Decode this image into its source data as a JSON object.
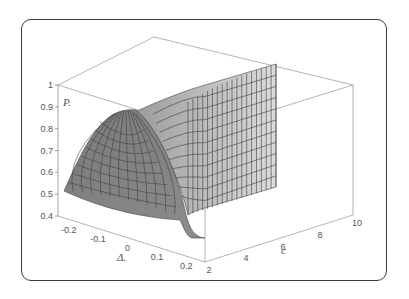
{
  "chart_data": {
    "type": "surface3d",
    "title": "",
    "zlabel": "P.",
    "xlabel": "Δ.",
    "ylabel": "c",
    "z_ticks": [
      "0.4",
      "0.5",
      "0.6",
      "0.7",
      "0.8",
      "0.9",
      "1"
    ],
    "x_ticks": [
      "-0.2",
      "-0.1",
      "0",
      "0.1",
      "0.2"
    ],
    "y_ticks": [
      "2",
      "4",
      "6",
      "8",
      "10"
    ],
    "zlim": [
      0.4,
      1.0
    ],
    "xlim": [
      -0.25,
      0.25
    ],
    "ylim": [
      2,
      10
    ],
    "sample_points": [
      {
        "delta": -0.25,
        "c": 2,
        "P": 0.5
      },
      {
        "delta": -0.1,
        "c": 2,
        "P": 0.8
      },
      {
        "delta": 0.0,
        "c": 2,
        "P": 0.9
      },
      {
        "delta": 0.05,
        "c": 3,
        "P": 0.6
      },
      {
        "delta": 0.08,
        "c": 2,
        "P": 0.42
      },
      {
        "delta": 0.1,
        "c": 6,
        "P": 0.8
      },
      {
        "delta": 0.1,
        "c": 10,
        "P": 0.97
      }
    ],
    "colors": {
      "surface_front": "#7d7d7d",
      "surface_wall": "#d0d0d0",
      "grid": "#3c3c3c",
      "box": "#9a9a9a"
    }
  }
}
